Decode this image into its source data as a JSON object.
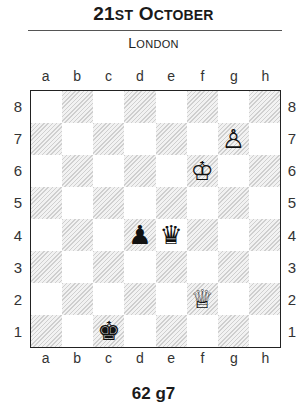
{
  "header": {
    "title_main": "21",
    "title_suffix": "ST",
    "title_o": "O",
    "title_rest": "CTOBER",
    "subtitle_l": "L",
    "subtitle_rest": "ONDON"
  },
  "board": {
    "files": [
      "a",
      "b",
      "c",
      "d",
      "e",
      "f",
      "g",
      "h"
    ],
    "ranks": [
      "8",
      "7",
      "6",
      "5",
      "4",
      "3",
      "2",
      "1"
    ],
    "pieces": {
      "g7": {
        "glyph": "♙",
        "name": "white-pawn"
      },
      "f6": {
        "glyph": "♔",
        "name": "white-king"
      },
      "d4": {
        "glyph": "♟",
        "name": "black-pawn"
      },
      "e4": {
        "glyph": "♛",
        "name": "black-queen"
      },
      "f2": {
        "glyph": "♕",
        "name": "white-queen"
      },
      "c1": {
        "glyph": "♚",
        "name": "black-king"
      }
    }
  },
  "caption": "62 g7"
}
